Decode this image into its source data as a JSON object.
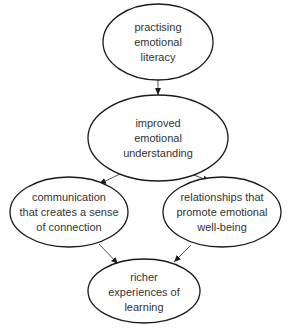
{
  "diagram": {
    "type": "flowchart",
    "nodes": [
      {
        "id": "practising",
        "lines": [
          "practising",
          "emotional",
          "literacy"
        ],
        "cx": 158,
        "cy": 42,
        "rx": 55,
        "ry": 38
      },
      {
        "id": "improved",
        "lines": [
          "improved",
          "emotional",
          "understanding"
        ],
        "cx": 158,
        "cy": 138,
        "rx": 70,
        "ry": 43
      },
      {
        "id": "communication",
        "lines": [
          "communication",
          "that creates a sense",
          "of connection"
        ],
        "cx": 69,
        "cy": 212,
        "rx": 59,
        "ry": 35
      },
      {
        "id": "relationships",
        "lines": [
          "relationships that",
          "promote emotional",
          "well-being"
        ],
        "cx": 222,
        "cy": 212,
        "rx": 59,
        "ry": 35
      },
      {
        "id": "richer",
        "lines": [
          "richer",
          "experiences of",
          "learning"
        ],
        "cx": 144,
        "cy": 291,
        "rx": 56,
        "ry": 32
      }
    ],
    "edges": [
      {
        "from": "practising",
        "to": "improved"
      },
      {
        "from": "improved",
        "to": "communication"
      },
      {
        "from": "improved",
        "to": "relationships"
      },
      {
        "from": "communication",
        "to": "richer"
      },
      {
        "from": "relationships",
        "to": "richer"
      }
    ]
  }
}
